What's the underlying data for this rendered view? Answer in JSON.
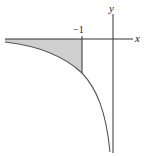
{
  "diagram": {
    "axes": {
      "x_label": "x",
      "y_label": "y"
    },
    "tick_label": "−1",
    "curve": "y = 1/x (x < 0 branch)",
    "shaded_region": "area between x-axis and curve for x ≤ −1",
    "colors": {
      "axis": "#333333",
      "curve": "#555555",
      "shade": "#cccccc"
    }
  }
}
